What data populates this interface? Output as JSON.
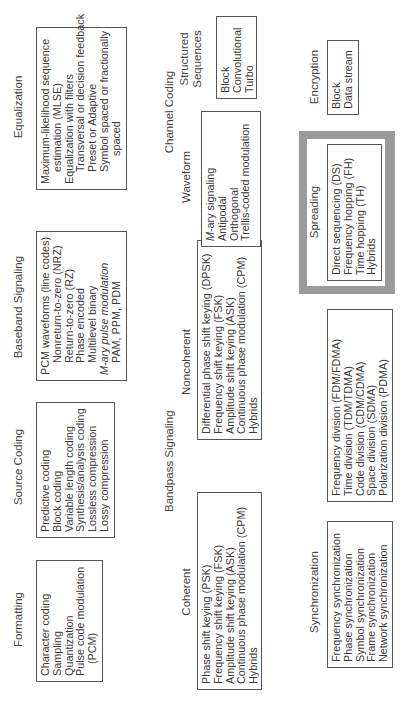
{
  "formatting": {
    "title": "Formatting",
    "items": [
      "Character coding",
      "Sampling",
      "Quantization",
      "Pulse code modulation",
      "(PCM)"
    ]
  },
  "source_coding": {
    "title": "Source Coding",
    "items": [
      "Predictive coding",
      "Block coding",
      "Variable length coding",
      "Synthesis/analysis coding",
      "Lossless compression",
      "Lossy compression"
    ]
  },
  "baseband": {
    "title": "Baseband Signaling",
    "items": [
      "PCM waveforms (line codes)",
      "Nonreturn-to-zero (NRZ)",
      "Return-to-zero (RZ)",
      "Phase encoded",
      "Multilevel binary",
      "M-ary pulse modulation",
      "PAM, PPM, PDM"
    ]
  },
  "equalization": {
    "title": "Equalization",
    "items": [
      "Maximum-likelihood sequence",
      "estimation (MLSE)",
      "Equalization with filters",
      "Transversal or decision feedback",
      "Preset or Adaptive",
      "Symbol spaced or fractionally",
      "spaced"
    ]
  },
  "bandpass": {
    "title": "Bandpass Signaling",
    "coherent": {
      "title": "Coherent",
      "items": [
        "Phase shift keying (PSK)",
        "Frequency shift keying (FSK)",
        "Amplitude shift keying (ASK)",
        "Continuous phase modulation (CPM)",
        "Hybrids"
      ]
    },
    "noncoherent": {
      "title": "Noncoherent",
      "items": [
        "Differential phase shift keying (DPSK)",
        "Frequency shift keying (FSK)",
        "Amplitude shift keying (ASK)",
        "Continuous phase modulation (CPM)",
        "Hybrids"
      ]
    }
  },
  "channel_coding": {
    "title": "Channel Coding",
    "waveform": {
      "title": "Waveform",
      "items": [
        "M-ary signaling",
        "Antipodal",
        "Orthogonal",
        "Trellis-coded modulation"
      ]
    },
    "structured": {
      "title_line1": "Structured",
      "title_line2": "Sequences",
      "items": [
        "Block",
        "Convolutional",
        "Turbo"
      ]
    }
  },
  "synchronization": {
    "title": "Synchronization",
    "items": [
      "Frequency synchronization",
      "Phase synchronization",
      "Symbol synchronization",
      "Frame synchronization",
      "Network synchronization"
    ]
  },
  "multiple_access": {
    "items": [
      "Frequency division (FDM/FDMA)",
      "Time division (TDM/TDMA)",
      "Code division (CDM/CDMA)",
      "Space division (SDMA)",
      "Polarization division (PDMA)"
    ]
  },
  "spreading": {
    "title": "Spreading",
    "items": [
      "Direct sequencing (DS)",
      "Frequency hopping (FH)",
      "Time hopping (TH)",
      "Hybrids"
    ]
  },
  "encryption": {
    "title": "Encryption",
    "items": [
      "Block",
      "Data stream"
    ]
  },
  "colors": {
    "frame_gray": "#9a9a9a",
    "border": "#555555",
    "text": "#3a3a3a"
  }
}
